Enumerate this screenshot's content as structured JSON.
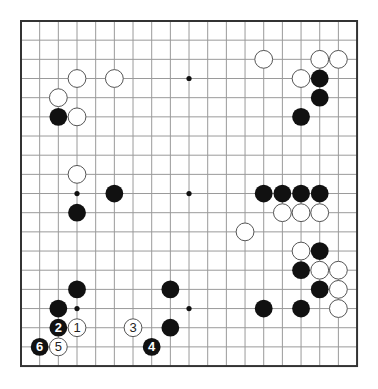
{
  "board": {
    "size": 19,
    "origin": {
      "x": 21,
      "y": 21
    },
    "spacing": {
      "x": 18.67,
      "y": 19.17
    },
    "colors": {
      "background": "#ffffff",
      "grid": "#9a9a9a",
      "border": "#333333",
      "black": "#111111",
      "white": "#ffffff",
      "white_outline": "#555555"
    },
    "star_points": [
      [
        3,
        3
      ],
      [
        9,
        3
      ],
      [
        15,
        3
      ],
      [
        3,
        9
      ],
      [
        9,
        9
      ],
      [
        15,
        9
      ],
      [
        3,
        15
      ],
      [
        9,
        15
      ],
      [
        15,
        15
      ]
    ],
    "white_stones": [
      [
        3,
        3
      ],
      [
        5,
        3
      ],
      [
        2,
        4
      ],
      [
        3,
        5
      ],
      [
        13,
        2
      ],
      [
        16,
        2
      ],
      [
        17,
        2
      ],
      [
        15,
        3
      ],
      [
        3,
        8
      ],
      [
        14,
        10
      ],
      [
        15,
        10
      ],
      [
        16,
        10
      ],
      [
        12,
        11
      ],
      [
        15,
        12
      ],
      [
        16,
        13
      ],
      [
        17,
        13
      ],
      [
        17,
        14
      ],
      [
        17,
        15
      ]
    ],
    "black_stones": [
      [
        16,
        3
      ],
      [
        16,
        4
      ],
      [
        15,
        5
      ],
      [
        2,
        5
      ],
      [
        5,
        9
      ],
      [
        3,
        10
      ],
      [
        13,
        9
      ],
      [
        14,
        9
      ],
      [
        15,
        9
      ],
      [
        16,
        9
      ],
      [
        16,
        12
      ],
      [
        15,
        13
      ],
      [
        16,
        14
      ],
      [
        15,
        15
      ],
      [
        13,
        15
      ],
      [
        3,
        14
      ],
      [
        2,
        15
      ],
      [
        8,
        14
      ],
      [
        8,
        16
      ]
    ],
    "numbered_moves": [
      {
        "n": "1",
        "color": "white",
        "pos": [
          3,
          16
        ]
      },
      {
        "n": "2",
        "color": "black",
        "pos": [
          2,
          16
        ]
      },
      {
        "n": "3",
        "color": "white",
        "pos": [
          6,
          16
        ]
      },
      {
        "n": "4",
        "color": "black",
        "pos": [
          7,
          17
        ]
      },
      {
        "n": "5",
        "color": "white",
        "pos": [
          2,
          17
        ]
      },
      {
        "n": "6",
        "color": "black",
        "pos": [
          1,
          17
        ]
      }
    ]
  }
}
